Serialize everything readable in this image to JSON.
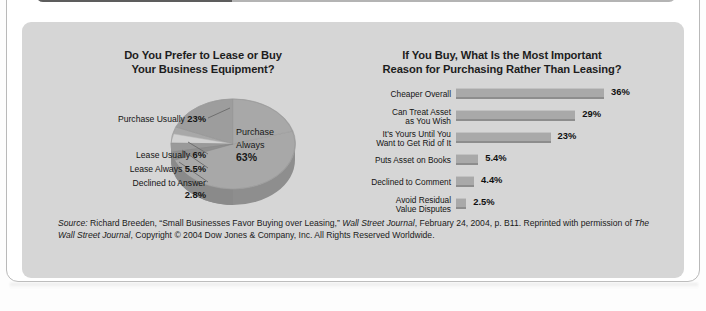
{
  "page": {
    "background_color": "#ffffff",
    "panel_color": "#d6d6d6",
    "accent_dark": "#5d5d5d",
    "bar_color": "#a9a9a9",
    "top_bar_text": "."
  },
  "pie_panel": {
    "title": "Do You Prefer to Lease or Buy Your Business Equipment?",
    "title_line1": "Do You Prefer to Lease or Buy",
    "title_line2": "Your Business Equipment?",
    "center_label_line1": "Purchase",
    "center_label_line2": "Always",
    "center_label_value": "63%",
    "labels": [
      {
        "name": "Purchase Usually",
        "value": "23%"
      },
      {
        "name": "Lease Usually",
        "value": "6%"
      },
      {
        "name": "Lease Always",
        "value": "5.5%"
      },
      {
        "name": "Declined to Answer",
        "value": "2.8%"
      }
    ]
  },
  "bar_panel": {
    "title": "If You Buy, What Is the Most Important Reason for Purchasing Rather Than Leasing?",
    "title_line1": "If You Buy, What Is the Most Important",
    "title_line2": "Reason for Purchasing Rather Than Leasing?",
    "rows": [
      {
        "label_line1": "Cheaper Overall",
        "label_line2": "",
        "value": "36%",
        "pct": 36
      },
      {
        "label_line1": "Can Treat Asset",
        "label_line2": "as You Wish",
        "value": "29%",
        "pct": 29
      },
      {
        "label_line1": "It's Yours Until You",
        "label_line2": "Want to Get Rid of It",
        "value": "23%",
        "pct": 23
      },
      {
        "label_line1": "Puts Asset on Books",
        "label_line2": "",
        "value": "5.4%",
        "pct": 5.4
      },
      {
        "label_line1": "Declined to Comment",
        "label_line2": "",
        "value": "4.4%",
        "pct": 4.4
      },
      {
        "label_line1": "Avoid Residual",
        "label_line2": "Value Disputes",
        "value": "2.5%",
        "pct": 2.5
      }
    ]
  },
  "source": {
    "label": "Source:",
    "text_1": " Richard Breeden, “Small Businesses Favor Buying over Leasing,” ",
    "italic_1": "Wall Street Journal",
    "text_2": ", February 24, 2004, p. B11. Reprinted with permission of ",
    "italic_2": "The Wall Street Journal",
    "text_3": ", Copyright © 2004 Dow Jones & Company, Inc. All Rights Reserved Worldwide."
  },
  "chart_data": [
    {
      "type": "pie",
      "title": "Do You Prefer to Lease or Buy Your Business Equipment?",
      "labels": [
        "Purchase Always",
        "Purchase Usually",
        "Lease Usually",
        "Lease Always",
        "Declined to Answer"
      ],
      "values": [
        63,
        23,
        6,
        5.5,
        2.8
      ],
      "value_labels": [
        "63%",
        "23%",
        "6%",
        "5.5%",
        "2.8%"
      ],
      "unit": "percent",
      "legend": "labels with leader lines",
      "three_d": true
    },
    {
      "type": "bar",
      "orientation": "horizontal",
      "title": "If You Buy, What Is the Most Important Reason for Purchasing Rather Than Leasing?",
      "categories": [
        "Cheaper Overall",
        "Can Treat Asset as You Wish",
        "It's Yours Until You Want to Get Rid of It",
        "Puts Asset on Books",
        "Declined to Comment",
        "Avoid Residual Value Disputes"
      ],
      "values": [
        36,
        29,
        23,
        5.4,
        4.4,
        2.5
      ],
      "value_labels": [
        "36%",
        "29%",
        "23%",
        "5.4%",
        "4.4%",
        "2.5%"
      ],
      "xlabel": "",
      "ylabel": "",
      "xlim": [
        0,
        36
      ],
      "grid": false,
      "legend": "none"
    }
  ]
}
